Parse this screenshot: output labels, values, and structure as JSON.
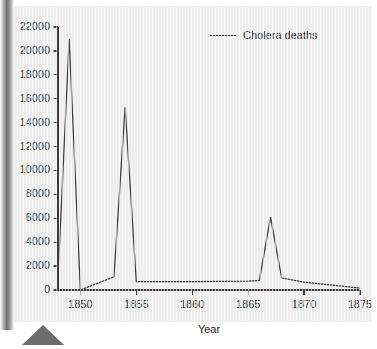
{
  "chart_data": {
    "type": "line",
    "title": "",
    "xlabel": "Year",
    "ylabel": "",
    "xlim": [
      1848,
      1875
    ],
    "ylim": [
      0,
      22000
    ],
    "grid": false,
    "legend": {
      "position": "top-right",
      "entries": [
        {
          "label": "Cholera deaths",
          "color": "#3a3a3a",
          "marker": "line"
        }
      ]
    },
    "x_tick_labels": [
      "1850",
      "1855",
      "1860",
      "1865",
      "1870",
      "1875"
    ],
    "x_ticks": [
      1850,
      1855,
      1860,
      1865,
      1870,
      1875
    ],
    "y_tick_labels": [
      "0",
      "2000",
      "4000",
      "6000",
      "8000",
      "10000",
      "12000",
      "14000",
      "16000",
      "18000",
      "20000",
      "22000"
    ],
    "y_ticks": [
      0,
      2000,
      4000,
      6000,
      8000,
      10000,
      12000,
      14000,
      16000,
      18000,
      20000,
      22000
    ],
    "series": [
      {
        "name": "Cholera deaths",
        "color": "#3a3a3a",
        "x": [
          1848,
          1849,
          1850,
          1853,
          1854,
          1855,
          1860,
          1865,
          1866,
          1867,
          1868,
          1870,
          1875
        ],
        "values": [
          1100,
          21000,
          0,
          1100,
          15300,
          700,
          700,
          750,
          800,
          6100,
          1000,
          650,
          150
        ]
      }
    ]
  },
  "axis": {
    "x_title": "Year"
  },
  "colors": {
    "line": "#3a3a3a",
    "axis": "#3a3a3a",
    "text": "#2b2b2b",
    "plot_background": "#ececec"
  }
}
